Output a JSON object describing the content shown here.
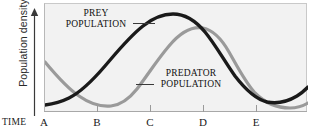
{
  "figure": {
    "ylabel": "Population density",
    "xlabel": "TIME"
  },
  "labels": {
    "prey_line1": "PREY",
    "prey_line2": "POPULATION",
    "predator_line1": "PREDATOR",
    "predator_line2": "POPULATION"
  },
  "colors": {
    "prey_curve": "#1a1a1a",
    "predator_curve": "#9a9a9a",
    "plot_background": "#f2f2f2",
    "axis": "#a8a8a8"
  },
  "xticks": [
    {
      "label": "A",
      "x": 0
    },
    {
      "label": "B",
      "x": 1
    },
    {
      "label": "C",
      "x": 2
    },
    {
      "label": "D",
      "x": 3
    },
    {
      "label": "E",
      "x": 4
    }
  ],
  "chart_data": {
    "type": "line",
    "title": "",
    "xlabel": "TIME",
    "ylabel": "Population density",
    "grid": false,
    "legend": "inline-annotations",
    "xlim": [
      0,
      4.4
    ],
    "ylim": [
      0,
      1
    ],
    "tick_labels": [
      "A",
      "B",
      "C",
      "D",
      "E"
    ],
    "series": [
      {
        "name": "PREY POPULATION",
        "color": "#1a1a1a",
        "points": [
          {
            "x": 0.0,
            "y": 0.07
          },
          {
            "x": 0.2,
            "y": 0.09
          },
          {
            "x": 0.4,
            "y": 0.14
          },
          {
            "x": 0.6,
            "y": 0.22
          },
          {
            "x": 0.85,
            "y": 0.33
          },
          {
            "x": 1.1,
            "y": 0.47
          },
          {
            "x": 1.4,
            "y": 0.63
          },
          {
            "x": 1.7,
            "y": 0.78
          },
          {
            "x": 2.0,
            "y": 0.89
          },
          {
            "x": 2.15,
            "y": 0.91
          },
          {
            "x": 2.35,
            "y": 0.9
          },
          {
            "x": 2.6,
            "y": 0.83
          },
          {
            "x": 2.9,
            "y": 0.68
          },
          {
            "x": 3.2,
            "y": 0.48
          },
          {
            "x": 3.5,
            "y": 0.28
          },
          {
            "x": 3.75,
            "y": 0.15
          },
          {
            "x": 3.95,
            "y": 0.1
          },
          {
            "x": 4.15,
            "y": 0.12
          },
          {
            "x": 4.4,
            "y": 0.19
          }
        ]
      },
      {
        "name": "PREDATOR POPULATION",
        "color": "#9a9a9a",
        "points": [
          {
            "x": 0.0,
            "y": 0.46
          },
          {
            "x": 0.25,
            "y": 0.34
          },
          {
            "x": 0.5,
            "y": 0.24
          },
          {
            "x": 0.75,
            "y": 0.16
          },
          {
            "x": 1.0,
            "y": 0.12
          },
          {
            "x": 1.25,
            "y": 0.11
          },
          {
            "x": 1.5,
            "y": 0.14
          },
          {
            "x": 1.8,
            "y": 0.24
          },
          {
            "x": 2.1,
            "y": 0.4
          },
          {
            "x": 2.4,
            "y": 0.58
          },
          {
            "x": 2.7,
            "y": 0.72
          },
          {
            "x": 2.9,
            "y": 0.76
          },
          {
            "x": 3.1,
            "y": 0.75
          },
          {
            "x": 3.4,
            "y": 0.66
          },
          {
            "x": 3.7,
            "y": 0.5
          },
          {
            "x": 4.0,
            "y": 0.31
          },
          {
            "x": 4.2,
            "y": 0.2
          },
          {
            "x": 4.4,
            "y": 0.14
          }
        ]
      }
    ],
    "annotations": [
      {
        "text": "PREY POPULATION",
        "target_series": "PREY POPULATION"
      },
      {
        "text": "PREDATOR POPULATION",
        "target_series": "PREDATOR POPULATION"
      }
    ]
  }
}
